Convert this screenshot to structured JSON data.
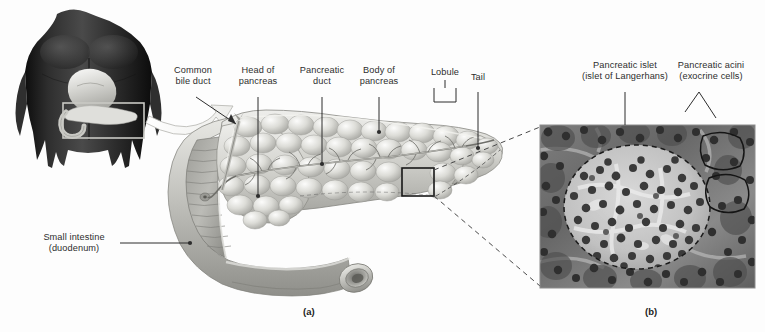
{
  "figure": {
    "title_text": "",
    "background_color": "#fdfdfd",
    "ink_color": "#2d2d2d",
    "panels": [
      {
        "id": "panel-a",
        "label": "(a)",
        "x": 303,
        "y": 306
      },
      {
        "id": "panel-b",
        "label": "(b)",
        "x": 645,
        "y": 306
      }
    ]
  },
  "labels": {
    "common_bile_duct": "Common\nbile duct",
    "head_of_pancreas": "Head of\npancreas",
    "pancreatic_duct": "Pancreatic\nduct",
    "body_of_pancreas": "Body of\npancreas",
    "lobule": "Lobule",
    "tail": "Tail",
    "small_intestine": "Small intestine\n(duodenum)",
    "pancreatic_islet": "Pancreatic islet\n(islet of Langerhans)",
    "pancreatic_acini": "Pancreatic acini\n(exocrine cells)"
  },
  "illustration_a": {
    "name": "pancreas-and-duodenum-illustration",
    "description": "Grayscale anatomical drawing of the pancreas with lobulated surface, pancreatic duct, and the cut-open duodenum curving below",
    "torso_inset": {
      "name": "body-orientation-inset",
      "description": "Dark grayscale male torso showing location of pancreas and stomach",
      "highlight_box": {
        "x": 63,
        "y": 103,
        "width": 81,
        "height": 35
      }
    },
    "magnification_box": {
      "x": 402,
      "y": 168,
      "width": 32,
      "height": 28
    },
    "colors": {
      "organ_light": "#dededa",
      "organ_mid": "#b9b9b4",
      "organ_dark": "#8e8e8a",
      "torso_dark": "#262626"
    }
  },
  "micrograph_b": {
    "name": "pancreas-histology-micrograph",
    "description": "Grayscale light-microscope image of pancreatic tissue; a large pale pancreatic islet outlined by a dashed ellipse is surrounded by darker acinar tissue with many stained nuclei",
    "bounds": {
      "x": 540,
      "y": 125,
      "width": 215,
      "height": 163
    },
    "islet_outline_style": "dashed",
    "acini_outline_count": 2
  }
}
